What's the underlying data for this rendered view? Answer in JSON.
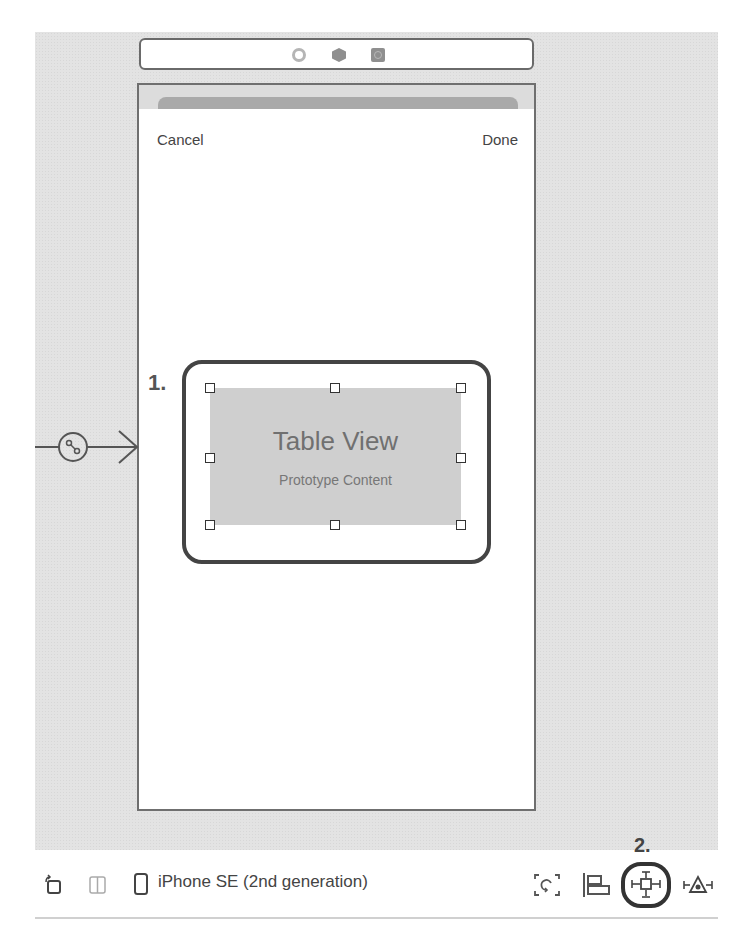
{
  "scene_dock": {
    "icons": [
      "first-responder-icon",
      "view-controller-icon",
      "exit-icon"
    ]
  },
  "phone": {
    "nav_bar": {
      "left_button": "Cancel",
      "right_button": "Done"
    },
    "table_view": {
      "title": "Table View",
      "subtitle": "Prototype Content"
    }
  },
  "annotations": {
    "step1": "1.",
    "step2": "2."
  },
  "segue": {
    "type": "entry-point-arrow"
  },
  "toolbar": {
    "device": "iPhone SE (2nd generation)",
    "left_icons": [
      "orientation-icon",
      "split-view-icon",
      "device-icon"
    ],
    "right_icons": [
      "update-frames-icon",
      "align-icon",
      "add-new-constraints-icon",
      "resolve-autolayout-issues-icon"
    ]
  },
  "colors": {
    "canvas": "#e3e3e3",
    "highlight": "#444444",
    "table_view_bg": "#cfcfcf"
  }
}
